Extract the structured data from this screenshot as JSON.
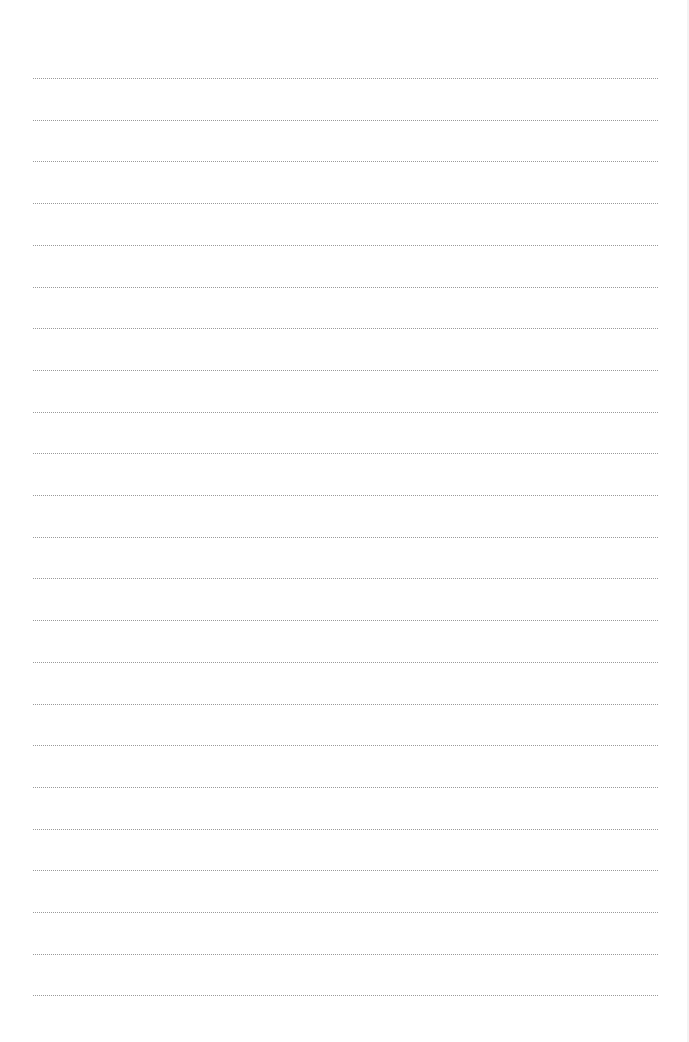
{
  "page": {
    "type": "lined-paper",
    "line_count": 23,
    "first_line_y": 78,
    "line_spacing": 41.7,
    "line_left": 33,
    "line_width": 625,
    "line_color": "#9a9a9a",
    "background_color": "#ffffff"
  }
}
